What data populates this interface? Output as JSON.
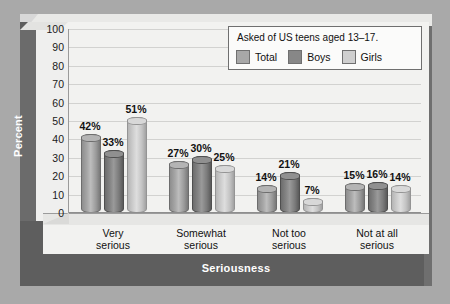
{
  "chart_data": {
    "type": "bar",
    "title": "",
    "xlabel": "Seriousness",
    "ylabel": "Percent",
    "ylim": [
      0,
      100
    ],
    "yticks": [
      100,
      90,
      80,
      70,
      60,
      50,
      40,
      30,
      20,
      10,
      0
    ],
    "grid": true,
    "value_suffix": "%",
    "categories": [
      "Very serious",
      "Somewhat serious",
      "Not too serious",
      "Not at all serious"
    ],
    "category_lines": [
      [
        "Very",
        "serious"
      ],
      [
        "Somewhat",
        "serious"
      ],
      [
        "Not too",
        "serious"
      ],
      [
        "Not at all",
        "serious"
      ]
    ],
    "series": [
      {
        "name": "Total",
        "color": "#a8a8a8",
        "values": [
          42,
          27,
          14,
          15
        ],
        "labels": [
          "42%",
          "27%",
          "14%",
          "15%"
        ]
      },
      {
        "name": "Boys",
        "color": "#878787",
        "values": [
          33,
          30,
          21,
          16
        ],
        "labels": [
          "33%",
          "30%",
          "21%",
          "16%"
        ]
      },
      {
        "name": "Girls",
        "color": "#cfcfcf",
        "values": [
          51,
          25,
          7,
          14
        ],
        "labels": [
          "51%",
          "25%",
          "7%",
          "14%"
        ]
      }
    ],
    "legend": {
      "position": "top-right",
      "note": "Asked of US teens aged 13–17.",
      "entries": [
        {
          "label": "Total",
          "color": "#a8a8a8"
        },
        {
          "label": "Boys",
          "color": "#878787"
        },
        {
          "label": "Girls",
          "color": "#cfcfcf"
        }
      ]
    },
    "colors": {
      "panel_background": "#f2f2f0",
      "frame": "#5e5e5e",
      "gridline": "#d2d2d0",
      "axis_title_text": "#ffffff",
      "tick_text": "#1a1a1a"
    }
  }
}
